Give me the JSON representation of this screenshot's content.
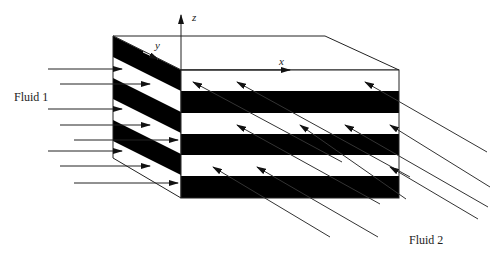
{
  "diagram": {
    "labels": {
      "fluid1": "Fluid 1",
      "fluid2": "Fluid 2",
      "axis_x": "x",
      "axis_y": "y",
      "axis_z": "z"
    },
    "colors": {
      "stripe": "#000000",
      "background": "#ffffff",
      "line": "#222222"
    },
    "block": {
      "back_top_left": [
        113,
        36
      ],
      "back_top_right": [
        325,
        36
      ],
      "front_top_left": [
        181,
        70
      ],
      "front_top_right": [
        399,
        70
      ],
      "front_bottom_left": [
        181,
        198
      ],
      "front_bottom_right": [
        399,
        198
      ],
      "back_bottom_left": [
        113,
        158
      ]
    },
    "front_stripes": [
      {
        "color": "white",
        "y0": 70,
        "y1": 91
      },
      {
        "color": "black",
        "y0": 91,
        "y1": 113
      },
      {
        "color": "white",
        "y0": 113,
        "y1": 134
      },
      {
        "color": "black",
        "y0": 134,
        "y1": 155
      },
      {
        "color": "white",
        "y0": 155,
        "y1": 176
      },
      {
        "color": "black",
        "y0": 176,
        "y1": 198
      }
    ],
    "fluid1_arrows": [
      {
        "x1": 48,
        "x2": 122,
        "y": 69
      },
      {
        "x1": 60,
        "x2": 150,
        "y": 84
      },
      {
        "x1": 48,
        "x2": 122,
        "y": 109
      },
      {
        "x1": 60,
        "x2": 150,
        "y": 125
      },
      {
        "x1": 74,
        "x2": 178,
        "y": 140
      },
      {
        "x1": 48,
        "x2": 122,
        "y": 151
      },
      {
        "x1": 60,
        "x2": 150,
        "y": 166
      },
      {
        "x1": 74,
        "x2": 178,
        "y": 183
      }
    ],
    "fluid2_arrows": [
      {
        "hx": 193,
        "hy": 82,
        "tx": 342,
        "ty": 162
      },
      {
        "hx": 237,
        "hy": 82,
        "tx": 410,
        "ty": 177
      },
      {
        "hx": 365,
        "hy": 82,
        "tx": 487,
        "ty": 152
      },
      {
        "hx": 237,
        "hy": 125,
        "tx": 380,
        "ty": 204
      },
      {
        "hx": 345,
        "hy": 125,
        "tx": 488,
        "ty": 207
      },
      {
        "hx": 390,
        "hy": 125,
        "tx": 490,
        "ty": 187
      },
      {
        "hx": 213,
        "hy": 167,
        "tx": 330,
        "ty": 237
      },
      {
        "hx": 257,
        "hy": 167,
        "tx": 378,
        "ty": 237
      },
      {
        "hx": 390,
        "hy": 167,
        "tx": 478,
        "ty": 219
      },
      {
        "hx": 300,
        "hy": 125,
        "tx": 406,
        "ty": 199
      }
    ]
  }
}
